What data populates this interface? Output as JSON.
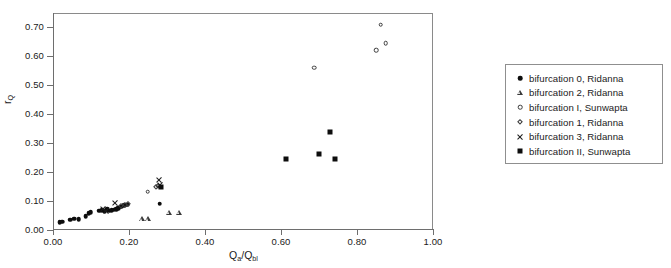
{
  "chart_data": {
    "type": "scatter",
    "title": "",
    "xlabel": "Qa/Qbl",
    "xlabel_parts": {
      "base1": "Q",
      "sub1": "a",
      "slash": "/",
      "base2": "Q",
      "sub2": "bl"
    },
    "ylabel": "rQ",
    "ylabel_parts": {
      "base": "r",
      "sub": "Q"
    },
    "xlim": [
      0.0,
      1.0
    ],
    "ylim": [
      0.0,
      0.75
    ],
    "xticks": [
      0.0,
      0.2,
      0.4,
      0.6,
      0.8,
      1.0
    ],
    "xtick_labels": [
      "0.00",
      "0.20",
      "0.40",
      "0.60",
      "0.80",
      "1.00"
    ],
    "yticks": [
      0.0,
      0.1,
      0.2,
      0.3,
      0.4,
      0.5,
      0.6,
      0.7
    ],
    "ytick_labels": [
      "0.00",
      "0.10",
      "0.20",
      "0.30",
      "0.40",
      "0.50",
      "0.60",
      "0.70"
    ],
    "grid": false,
    "legend_position": "right-outside",
    "series": [
      {
        "name": "bifurcation 0, Ridanna",
        "marker": "filled-circle",
        "color": "#0d0d0d",
        "points": [
          [
            0.018,
            0.026
          ],
          [
            0.024,
            0.028
          ],
          [
            0.046,
            0.036
          ],
          [
            0.056,
            0.039
          ],
          [
            0.068,
            0.038
          ],
          [
            0.086,
            0.048
          ],
          [
            0.094,
            0.058
          ],
          [
            0.099,
            0.061
          ],
          [
            0.122,
            0.066
          ],
          [
            0.13,
            0.069
          ],
          [
            0.136,
            0.064
          ],
          [
            0.142,
            0.071
          ],
          [
            0.148,
            0.067
          ],
          [
            0.155,
            0.069
          ],
          [
            0.16,
            0.07
          ],
          [
            0.166,
            0.072
          ],
          [
            0.172,
            0.075
          ],
          [
            0.18,
            0.08
          ],
          [
            0.188,
            0.085
          ],
          [
            0.196,
            0.088
          ],
          [
            0.281,
            0.091
          ]
        ]
      },
      {
        "name": "bifurcation 2, Ridanna",
        "marker": "open-triangle",
        "color": "#3a3a3a",
        "points": [
          [
            0.234,
            0.038
          ],
          [
            0.25,
            0.038
          ],
          [
            0.305,
            0.06
          ],
          [
            0.331,
            0.06
          ]
        ]
      },
      {
        "name": "bifurcation I, Sunwapta",
        "marker": "open-circle",
        "color": "#3a3a3a",
        "points": [
          [
            0.249,
            0.133
          ],
          [
            0.688,
            0.561
          ],
          [
            0.851,
            0.621
          ],
          [
            0.862,
            0.71
          ],
          [
            0.876,
            0.646
          ]
        ]
      },
      {
        "name": "bifurcation 1, Ridanna",
        "marker": "open-diamond",
        "color": "#3a3a3a",
        "points": [
          [
            0.18,
            0.083
          ],
          [
            0.19,
            0.087
          ],
          [
            0.197,
            0.089
          ],
          [
            0.27,
            0.15
          ],
          [
            0.275,
            0.153
          ]
        ]
      },
      {
        "name": "bifurcation 3, Ridanna",
        "marker": "cross",
        "color": "#1a1a1a",
        "points": [
          [
            0.131,
            0.073
          ],
          [
            0.14,
            0.064
          ],
          [
            0.163,
            0.092
          ],
          [
            0.278,
            0.172
          ],
          [
            0.281,
            0.155
          ]
        ]
      },
      {
        "name": "bifurcation II, Sunwapta",
        "marker": "filled-square",
        "color": "#0d0d0d",
        "points": [
          [
            0.284,
            0.148
          ],
          [
            0.614,
            0.244
          ],
          [
            0.7,
            0.261
          ],
          [
            0.729,
            0.339
          ],
          [
            0.741,
            0.245
          ]
        ]
      }
    ]
  },
  "legend": {
    "items": [
      {
        "label": "bifurcation 0, Ridanna",
        "marker": "filled-circle"
      },
      {
        "label": "bifurcation 2, Ridanna",
        "marker": "open-triangle"
      },
      {
        "label": "bifurcation I, Sunwapta",
        "marker": "open-circle"
      },
      {
        "label": "bifurcation 1, Ridanna",
        "marker": "open-diamond"
      },
      {
        "label": "bifurcation 3, Ridanna",
        "marker": "cross"
      },
      {
        "label": "bifurcation II, Sunwapta",
        "marker": "filled-square"
      }
    ]
  }
}
